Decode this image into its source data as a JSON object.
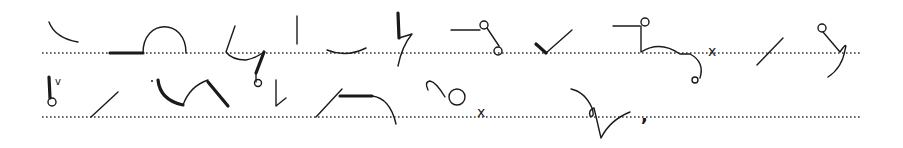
{
  "content": {
    "type": "pitman-shorthand-sample",
    "guide_lines": [
      {
        "name": "line-1",
        "y": 53,
        "x_start": 42,
        "x_end": 862
      },
      {
        "name": "line-2",
        "y": 117,
        "x_start": 42,
        "x_end": 862
      }
    ],
    "marks": [
      {
        "name": "x-mark-1",
        "text": "x"
      },
      {
        "name": "x-mark-2",
        "text": "x"
      },
      {
        "name": "v-mark",
        "text": "v"
      },
      {
        "name": "comma-mark",
        "text": ","
      }
    ],
    "ink_color": "#1a1a1a",
    "background_color": "#ffffff"
  }
}
